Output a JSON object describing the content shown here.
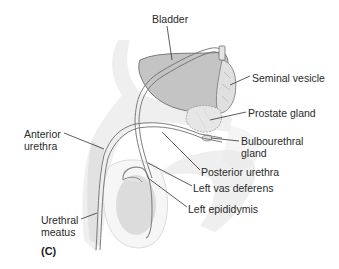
{
  "figure": {
    "panel_label": "(C)",
    "colors": {
      "bladder_fill": "#c4c4c4",
      "organ_outline": "#7a7a7a",
      "soft_tissue": "#ececec",
      "leader_line": "#333333",
      "text": "#2a2a2a"
    },
    "labels": [
      {
        "id": "bladder",
        "text": "Bladder"
      },
      {
        "id": "seminal-vesicle",
        "text": "Seminal vesicle"
      },
      {
        "id": "prostate-gland",
        "text": "Prostate gland"
      },
      {
        "id": "anterior-urethra-1",
        "text": "Anterior"
      },
      {
        "id": "anterior-urethra-2",
        "text": "urethra"
      },
      {
        "id": "bulbourethral-gland-1",
        "text": "Bulbourethral"
      },
      {
        "id": "bulbourethral-gland-2",
        "text": "gland"
      },
      {
        "id": "posterior-urethra",
        "text": "Posterior urethra"
      },
      {
        "id": "left-vas-deferens",
        "text": "Left vas deferens"
      },
      {
        "id": "left-epididymis",
        "text": "Left epididymis"
      },
      {
        "id": "urethral-meatus-1",
        "text": "Urethral"
      },
      {
        "id": "urethral-meatus-2",
        "text": "meatus"
      }
    ]
  }
}
